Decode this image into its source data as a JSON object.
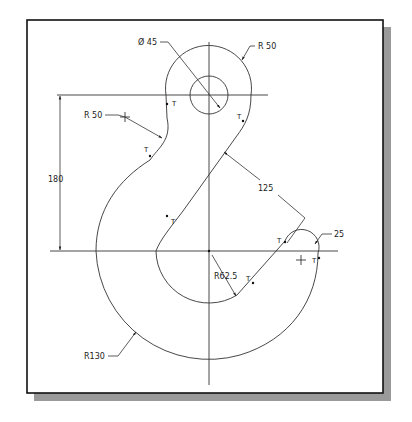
{
  "drawing": {
    "title": "Crane hook engineering drawing",
    "colors": {
      "background": "#ffffff",
      "frame_border": "#111111",
      "shadow": "#9a9a9a",
      "line": "#333333"
    },
    "dimensions": {
      "hole_diameter": "Ø 45",
      "eye_radius": "R 50",
      "neck_radius": "R 50",
      "vertical_distance": "180",
      "shank_distance": "125",
      "tip_radius": "25",
      "inner_radius": "R62.5",
      "outer_radius": "R130"
    },
    "tangent_marks": [
      "T",
      "T",
      "T",
      "T",
      "T",
      "T",
      "T",
      "T"
    ]
  }
}
